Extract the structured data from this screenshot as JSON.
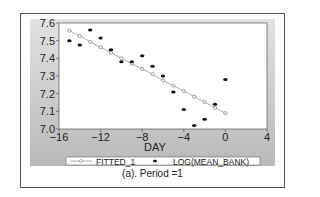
{
  "chart_data": {
    "type": "scatter",
    "title": "",
    "caption": "(a). Period =1",
    "xlabel": "DAY",
    "ylabel": "",
    "xlim": [
      -16,
      4
    ],
    "ylim": [
      7.0,
      7.6
    ],
    "xticks": [
      "-16",
      "-12",
      "-8",
      "-4",
      "0",
      "4"
    ],
    "yticks": [
      "7.0",
      "7.1",
      "7.2",
      "7.3",
      "7.4",
      "7.5",
      "7.6"
    ],
    "grid": false,
    "legend_position": "bottom",
    "x": [
      -15,
      -14,
      -13,
      -12,
      -11,
      -10,
      -9,
      -8,
      -7,
      -6,
      -5,
      -4,
      -3,
      -2,
      -1,
      0
    ],
    "series": [
      {
        "name": "FITTED_1",
        "style": "line-open-circle",
        "values": [
          7.556,
          7.527,
          7.493,
          7.463,
          7.432,
          7.4,
          7.37,
          7.34,
          7.31,
          7.275,
          7.245,
          7.215,
          7.183,
          7.153,
          7.12,
          7.09
        ]
      },
      {
        "name": "LOG(MEAN_BANK)",
        "style": "filled-dot",
        "values": [
          7.5,
          7.476,
          7.56,
          7.515,
          7.448,
          7.38,
          7.38,
          7.415,
          7.355,
          7.3,
          7.21,
          7.11,
          7.02,
          7.055,
          7.14,
          7.28
        ]
      }
    ]
  }
}
